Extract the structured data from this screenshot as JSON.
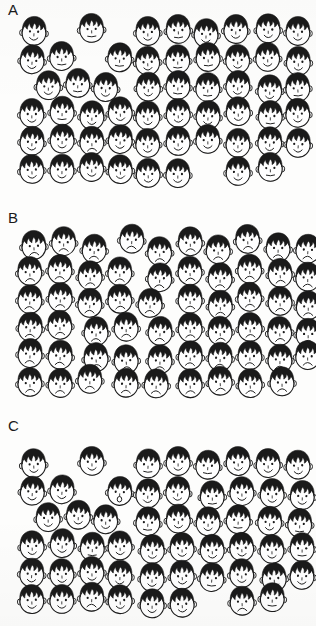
{
  "figure": {
    "background_color": "#fdfdfc",
    "ink_color": "#1a1a1a",
    "hair_color": "#1a1a1a",
    "skin_color": "#ffffff",
    "width": 316,
    "height": 626
  },
  "panels": [
    {
      "id": "a",
      "label": "A",
      "description": "Mostly smiling faces with a few sad faces scattered",
      "face_count": 54,
      "faces": [
        {
          "x": 14,
          "y": 12,
          "mood": "happy"
        },
        {
          "x": 72,
          "y": 9,
          "mood": "neutral"
        },
        {
          "x": 128,
          "y": 12,
          "mood": "happy"
        },
        {
          "x": 158,
          "y": 10,
          "mood": "neutral"
        },
        {
          "x": 186,
          "y": 14,
          "mood": "happy"
        },
        {
          "x": 216,
          "y": 10,
          "mood": "happy"
        },
        {
          "x": 248,
          "y": 9,
          "mood": "happy"
        },
        {
          "x": 278,
          "y": 12,
          "mood": "happy"
        },
        {
          "x": 12,
          "y": 40,
          "mood": "happy"
        },
        {
          "x": 42,
          "y": 37,
          "mood": "neutral"
        },
        {
          "x": 100,
          "y": 38,
          "mood": "neutral"
        },
        {
          "x": 128,
          "y": 42,
          "mood": "happy"
        },
        {
          "x": 158,
          "y": 40,
          "mood": "neutral"
        },
        {
          "x": 188,
          "y": 38,
          "mood": "neutral"
        },
        {
          "x": 218,
          "y": 40,
          "mood": "happy"
        },
        {
          "x": 248,
          "y": 38,
          "mood": "happy"
        },
        {
          "x": 278,
          "y": 42,
          "mood": "happy"
        },
        {
          "x": 28,
          "y": 66,
          "mood": "happy"
        },
        {
          "x": 58,
          "y": 64,
          "mood": "neutral"
        },
        {
          "x": 86,
          "y": 68,
          "mood": "happy"
        },
        {
          "x": 128,
          "y": 68,
          "mood": "happy"
        },
        {
          "x": 158,
          "y": 66,
          "mood": "neutral"
        },
        {
          "x": 188,
          "y": 68,
          "mood": "neutral"
        },
        {
          "x": 218,
          "y": 66,
          "mood": "happy"
        },
        {
          "x": 250,
          "y": 70,
          "mood": "happy"
        },
        {
          "x": 278,
          "y": 68,
          "mood": "neutral"
        },
        {
          "x": 12,
          "y": 94,
          "mood": "happy"
        },
        {
          "x": 42,
          "y": 92,
          "mood": "neutral"
        },
        {
          "x": 72,
          "y": 96,
          "mood": "happy"
        },
        {
          "x": 100,
          "y": 92,
          "mood": "happy"
        },
        {
          "x": 128,
          "y": 96,
          "mood": "happy"
        },
        {
          "x": 158,
          "y": 94,
          "mood": "happy"
        },
        {
          "x": 188,
          "y": 96,
          "mood": "happy"
        },
        {
          "x": 218,
          "y": 92,
          "mood": "happy"
        },
        {
          "x": 250,
          "y": 96,
          "mood": "neutral"
        },
        {
          "x": 278,
          "y": 94,
          "mood": "happy"
        },
        {
          "x": 12,
          "y": 122,
          "mood": "happy"
        },
        {
          "x": 42,
          "y": 120,
          "mood": "happy"
        },
        {
          "x": 72,
          "y": 122,
          "mood": "sad"
        },
        {
          "x": 100,
          "y": 120,
          "mood": "happy"
        },
        {
          "x": 128,
          "y": 124,
          "mood": "happy"
        },
        {
          "x": 158,
          "y": 122,
          "mood": "happy"
        },
        {
          "x": 188,
          "y": 120,
          "mood": "happy"
        },
        {
          "x": 218,
          "y": 124,
          "mood": "happy"
        },
        {
          "x": 250,
          "y": 122,
          "mood": "happy"
        },
        {
          "x": 278,
          "y": 124,
          "mood": "happy"
        },
        {
          "x": 12,
          "y": 150,
          "mood": "happy"
        },
        {
          "x": 42,
          "y": 150,
          "mood": "happy"
        },
        {
          "x": 72,
          "y": 148,
          "mood": "happy"
        },
        {
          "x": 100,
          "y": 150,
          "mood": "happy"
        },
        {
          "x": 128,
          "y": 154,
          "mood": "happy"
        },
        {
          "x": 158,
          "y": 154,
          "mood": "happy"
        },
        {
          "x": 218,
          "y": 152,
          "mood": "happy"
        },
        {
          "x": 250,
          "y": 148,
          "mood": "neutral"
        }
      ]
    },
    {
      "id": "b",
      "label": "B",
      "description": "All sad frowning faces",
      "face_count": 54,
      "faces": [
        {
          "x": 14,
          "y": 18,
          "mood": "sad"
        },
        {
          "x": 44,
          "y": 14,
          "mood": "sad"
        },
        {
          "x": 74,
          "y": 22,
          "mood": "sad"
        },
        {
          "x": 112,
          "y": 12,
          "mood": "sad"
        },
        {
          "x": 140,
          "y": 24,
          "mood": "sad"
        },
        {
          "x": 170,
          "y": 14,
          "mood": "sad"
        },
        {
          "x": 198,
          "y": 22,
          "mood": "sad"
        },
        {
          "x": 228,
          "y": 12,
          "mood": "sad"
        },
        {
          "x": 258,
          "y": 20,
          "mood": "sad"
        },
        {
          "x": 288,
          "y": 22,
          "mood": "sad"
        },
        {
          "x": 10,
          "y": 44,
          "mood": "sad"
        },
        {
          "x": 40,
          "y": 42,
          "mood": "sad"
        },
        {
          "x": 70,
          "y": 48,
          "mood": "sad"
        },
        {
          "x": 100,
          "y": 44,
          "mood": "sad"
        },
        {
          "x": 140,
          "y": 50,
          "mood": "sad"
        },
        {
          "x": 170,
          "y": 44,
          "mood": "sad"
        },
        {
          "x": 200,
          "y": 50,
          "mood": "sad"
        },
        {
          "x": 230,
          "y": 42,
          "mood": "sad"
        },
        {
          "x": 260,
          "y": 46,
          "mood": "sad"
        },
        {
          "x": 288,
          "y": 50,
          "mood": "sad"
        },
        {
          "x": 10,
          "y": 72,
          "mood": "sad"
        },
        {
          "x": 40,
          "y": 70,
          "mood": "sad"
        },
        {
          "x": 70,
          "y": 76,
          "mood": "sad"
        },
        {
          "x": 100,
          "y": 72,
          "mood": "sad"
        },
        {
          "x": 130,
          "y": 76,
          "mood": "sad"
        },
        {
          "x": 170,
          "y": 72,
          "mood": "sad"
        },
        {
          "x": 200,
          "y": 78,
          "mood": "sad"
        },
        {
          "x": 230,
          "y": 70,
          "mood": "sad"
        },
        {
          "x": 260,
          "y": 74,
          "mood": "sad"
        },
        {
          "x": 288,
          "y": 78,
          "mood": "sad"
        },
        {
          "x": 10,
          "y": 100,
          "mood": "sad"
        },
        {
          "x": 40,
          "y": 98,
          "mood": "sad"
        },
        {
          "x": 76,
          "y": 104,
          "mood": "sad"
        },
        {
          "x": 106,
          "y": 100,
          "mood": "sad"
        },
        {
          "x": 140,
          "y": 104,
          "mood": "sad"
        },
        {
          "x": 170,
          "y": 100,
          "mood": "sad"
        },
        {
          "x": 200,
          "y": 104,
          "mood": "sad"
        },
        {
          "x": 230,
          "y": 100,
          "mood": "sad"
        },
        {
          "x": 260,
          "y": 104,
          "mood": "sad"
        },
        {
          "x": 288,
          "y": 106,
          "mood": "sad"
        },
        {
          "x": 10,
          "y": 126,
          "mood": "sad"
        },
        {
          "x": 40,
          "y": 128,
          "mood": "sad"
        },
        {
          "x": 76,
          "y": 130,
          "mood": "sad"
        },
        {
          "x": 106,
          "y": 132,
          "mood": "sad"
        },
        {
          "x": 140,
          "y": 132,
          "mood": "sad"
        },
        {
          "x": 170,
          "y": 128,
          "mood": "sad"
        },
        {
          "x": 200,
          "y": 130,
          "mood": "sad"
        },
        {
          "x": 230,
          "y": 128,
          "mood": "sad"
        },
        {
          "x": 260,
          "y": 132,
          "mood": "sad"
        },
        {
          "x": 288,
          "y": 128,
          "mood": "sad"
        },
        {
          "x": 10,
          "y": 155,
          "mood": "sad"
        },
        {
          "x": 40,
          "y": 156,
          "mood": "sad"
        },
        {
          "x": 70,
          "y": 152,
          "mood": "sad"
        },
        {
          "x": 106,
          "y": 156,
          "mood": "sad"
        },
        {
          "x": 136,
          "y": 156,
          "mood": "sad"
        },
        {
          "x": 170,
          "y": 156,
          "mood": "sad"
        },
        {
          "x": 200,
          "y": 154,
          "mood": "sad"
        },
        {
          "x": 230,
          "y": 156,
          "mood": "sad"
        },
        {
          "x": 262,
          "y": 154,
          "mood": "sad"
        }
      ]
    },
    {
      "id": "c",
      "label": "C",
      "description": "Mostly smiling faces with one surprised open-mouth face",
      "face_count": 54,
      "faces": [
        {
          "x": 14,
          "y": 28,
          "mood": "happy"
        },
        {
          "x": 72,
          "y": 26,
          "mood": "happy"
        },
        {
          "x": 128,
          "y": 28,
          "mood": "neutral"
        },
        {
          "x": 158,
          "y": 26,
          "mood": "happy"
        },
        {
          "x": 188,
          "y": 30,
          "mood": "neutral"
        },
        {
          "x": 218,
          "y": 26,
          "mood": "happy"
        },
        {
          "x": 248,
          "y": 28,
          "mood": "happy"
        },
        {
          "x": 278,
          "y": 30,
          "mood": "happy"
        },
        {
          "x": 12,
          "y": 56,
          "mood": "happy"
        },
        {
          "x": 42,
          "y": 54,
          "mood": "happy"
        },
        {
          "x": 100,
          "y": 56,
          "mood": "surprised"
        },
        {
          "x": 128,
          "y": 58,
          "mood": "happy"
        },
        {
          "x": 158,
          "y": 56,
          "mood": "happy"
        },
        {
          "x": 192,
          "y": 60,
          "mood": "neutral"
        },
        {
          "x": 222,
          "y": 56,
          "mood": "happy"
        },
        {
          "x": 252,
          "y": 58,
          "mood": "happy"
        },
        {
          "x": 282,
          "y": 60,
          "mood": "happy"
        },
        {
          "x": 28,
          "y": 82,
          "mood": "happy"
        },
        {
          "x": 58,
          "y": 80,
          "mood": "happy"
        },
        {
          "x": 86,
          "y": 84,
          "mood": "happy"
        },
        {
          "x": 128,
          "y": 86,
          "mood": "neutral"
        },
        {
          "x": 158,
          "y": 84,
          "mood": "happy"
        },
        {
          "x": 188,
          "y": 86,
          "mood": "happy"
        },
        {
          "x": 218,
          "y": 84,
          "mood": "neutral"
        },
        {
          "x": 250,
          "y": 86,
          "mood": "happy"
        },
        {
          "x": 280,
          "y": 88,
          "mood": "neutral"
        },
        {
          "x": 12,
          "y": 110,
          "mood": "happy"
        },
        {
          "x": 42,
          "y": 108,
          "mood": "happy"
        },
        {
          "x": 72,
          "y": 112,
          "mood": "neutral"
        },
        {
          "x": 100,
          "y": 110,
          "mood": "happy"
        },
        {
          "x": 132,
          "y": 114,
          "mood": "happy"
        },
        {
          "x": 162,
          "y": 112,
          "mood": "happy"
        },
        {
          "x": 192,
          "y": 114,
          "mood": "happy"
        },
        {
          "x": 222,
          "y": 112,
          "mood": "happy"
        },
        {
          "x": 252,
          "y": 114,
          "mood": "happy"
        },
        {
          "x": 282,
          "y": 112,
          "mood": "neutral"
        },
        {
          "x": 12,
          "y": 138,
          "mood": "happy"
        },
        {
          "x": 42,
          "y": 138,
          "mood": "happy"
        },
        {
          "x": 72,
          "y": 136,
          "mood": "happy"
        },
        {
          "x": 100,
          "y": 140,
          "mood": "happy"
        },
        {
          "x": 132,
          "y": 142,
          "mood": "happy"
        },
        {
          "x": 162,
          "y": 140,
          "mood": "happy"
        },
        {
          "x": 192,
          "y": 142,
          "mood": "neutral"
        },
        {
          "x": 222,
          "y": 138,
          "mood": "happy"
        },
        {
          "x": 254,
          "y": 142,
          "mood": "happy"
        },
        {
          "x": 282,
          "y": 140,
          "mood": "happy"
        },
        {
          "x": 12,
          "y": 164,
          "mood": "happy"
        },
        {
          "x": 42,
          "y": 164,
          "mood": "happy"
        },
        {
          "x": 72,
          "y": 162,
          "mood": "sad"
        },
        {
          "x": 100,
          "y": 164,
          "mood": "happy"
        },
        {
          "x": 132,
          "y": 168,
          "mood": "happy"
        },
        {
          "x": 162,
          "y": 168,
          "mood": "happy"
        },
        {
          "x": 222,
          "y": 166,
          "mood": "sad"
        },
        {
          "x": 252,
          "y": 162,
          "mood": "neutral"
        }
      ]
    }
  ]
}
